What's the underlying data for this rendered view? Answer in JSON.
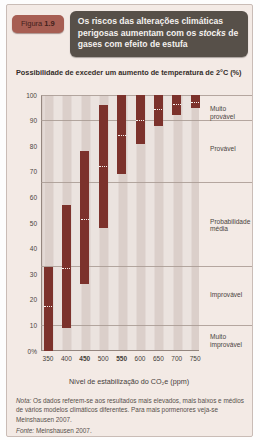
{
  "header": {
    "figure_label_prefix": "Figura ",
    "figure_label_number": "1.9",
    "title_pre": "Os riscos das alterações climáticas perigosas aumentam com os ",
    "title_italic": "stocks",
    "title_post": " de gases com efeito de estufa"
  },
  "chart_data": {
    "type": "bar",
    "subtype": "floating-range-bars",
    "title": "Possibilidade de exceder um aumento de temperatura de 2°C (%)",
    "categories": [
      "350",
      "400",
      "450",
      "500",
      "550",
      "600",
      "650",
      "700",
      "750"
    ],
    "bold_categories": [
      "450",
      "550"
    ],
    "series": [
      {
        "name": "máximo",
        "values": [
          33,
          57,
          78,
          96,
          100,
          100,
          100,
          100,
          100
        ]
      },
      {
        "name": "médio",
        "values": [
          17,
          32,
          51,
          72,
          84,
          90,
          94,
          96,
          97
        ]
      },
      {
        "name": "mínimo",
        "values": [
          0,
          9,
          26,
          48,
          69,
          81,
          88,
          92,
          95
        ]
      }
    ],
    "xlabel": "Nível de estabilização do CO₂e (ppm)",
    "ylabel": "",
    "ylim": [
      0,
      100
    ],
    "yticks": [
      100,
      90,
      80,
      70,
      60,
      50,
      40,
      30,
      20,
      10,
      0
    ],
    "ytick_labels": [
      "100",
      "90",
      "80",
      "70",
      "60",
      "50",
      "40",
      "30",
      "20",
      "10",
      "0%"
    ],
    "grid_values": [
      10,
      33,
      66,
      90,
      100
    ],
    "grid_on": true,
    "legend_position": "none",
    "likelihood_bands": [
      {
        "label": "Muito\nprovável",
        "center": 93
      },
      {
        "label": "Provável",
        "center": 79
      },
      {
        "label": "Probabilidade\nmédia",
        "center": 49
      },
      {
        "label": "Improvável",
        "center": 22
      },
      {
        "label": "Muito\nimprovável",
        "center": 4
      }
    ],
    "bar_color": "#7c322c",
    "mid_marker_color": "#f7f3f0"
  },
  "footer": {
    "note_label": "Nota:",
    "note_text": " Os dados referem-se aos resultados mais elevados, mais baixos e médios de vários modelos climáticos diferentes. Para mais pormenores veja-se Meinshausen 2007.",
    "source_label": "Fonte:",
    "source_text": " Meinshausen 2007."
  },
  "colors": {
    "panel_background": "#f3eae5",
    "badge_background": "#a75e53",
    "badge_text": "#42201b",
    "title_background": "#575049",
    "title_text": "#f4f1ee",
    "bar": "#7c322c",
    "stripe_dark": "#dbcfca",
    "stripe_light": "#ebe3df",
    "gridline": "#a89a93"
  }
}
